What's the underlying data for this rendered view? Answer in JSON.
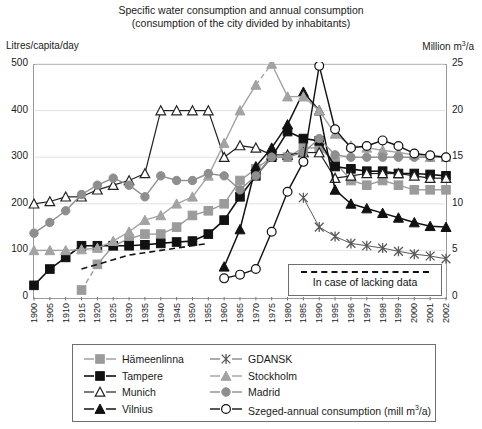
{
  "title": {
    "line1": "Specific water consumption and annual consumption",
    "line2": "(consumption of the city divided by inhabitants)"
  },
  "axis_labels": {
    "left": "Litres/capita/day",
    "right_prefix": "Million m",
    "right_sup": "3",
    "right_suffix": "/a"
  },
  "note_box": {
    "label": "In case of lacking data"
  },
  "legend": {
    "column1": [
      {
        "name": "Hämeenlinna",
        "marker": "square",
        "color": "#9b9b9b",
        "line": "#9b9b9b"
      },
      {
        "name": "Tampere",
        "marker": "square",
        "color": "#111111",
        "line": "#111111"
      },
      {
        "name": "Munich",
        "marker": "triangle-open",
        "color": "#ffffff",
        "line": "#111111"
      },
      {
        "name": "Vilnius",
        "marker": "triangle",
        "color": "#111111",
        "line": "#111111"
      }
    ],
    "column2": [
      {
        "name": "GDANSK",
        "marker": "star",
        "color": "#5a5a5a",
        "line": "#5a5a5a"
      },
      {
        "name": "Stockholm",
        "marker": "triangle",
        "color": "#9b9b9b",
        "line": "#9b9b9b"
      },
      {
        "name": "Madrid",
        "marker": "circle",
        "color": "#8a8a8a",
        "line": "#8a8a8a"
      },
      {
        "name": "Szeged-annual consumption (mill m3/a)",
        "marker": "circle-open",
        "color": "#ffffff",
        "line": "#111111"
      }
    ]
  },
  "chart_data": {
    "type": "line",
    "title": "Specific water consumption and annual consumption (consumption of the city divided by inhabitants)",
    "xlabel": "",
    "ylabel": "Litres/capita/day",
    "y2label": "Million m3/a",
    "grid": true,
    "legend_position": "bottom",
    "ylim": [
      0,
      500
    ],
    "yticks": [
      0,
      100,
      200,
      300,
      400,
      500
    ],
    "y2lim": [
      0,
      25
    ],
    "y2ticks": [
      0,
      5,
      10,
      15,
      20,
      25
    ],
    "categories": [
      "1900",
      "1905",
      "1910",
      "1915",
      "1920",
      "1925",
      "1930",
      "1935",
      "1940",
      "1945",
      "1950",
      "1955",
      "1960",
      "1965",
      "1970",
      "1975",
      "1980",
      "1985",
      "1990",
      "1995",
      "1996",
      "1997",
      "1998",
      "1999",
      "2000",
      "2001",
      "2002"
    ],
    "series": [
      {
        "name": "Hämeenlinna",
        "axis": "left",
        "values": [
          null,
          null,
          null,
          15,
          70,
          110,
          125,
          135,
          135,
          150,
          175,
          185,
          200,
          250,
          275,
          300,
          300,
          320,
          320,
          290,
          250,
          240,
          250,
          240,
          230,
          230,
          230
        ]
      },
      {
        "name": "Tampere",
        "axis": "left",
        "values": [
          25,
          60,
          85,
          110,
          110,
          110,
          110,
          112,
          115,
          118,
          120,
          135,
          165,
          215,
          260,
          300,
          355,
          340,
          335,
          280,
          275,
          270,
          270,
          265,
          265,
          263,
          260
        ]
      },
      {
        "name": "Munich",
        "axis": "left",
        "values": [
          200,
          205,
          215,
          215,
          230,
          240,
          250,
          265,
          400,
          400,
          400,
          400,
          300,
          325,
          320,
          305,
          305,
          310,
          310,
          255,
          260,
          265,
          265,
          265,
          260,
          255,
          255
        ]
      },
      {
        "name": "Vilnius",
        "axis": "left",
        "values": [
          null,
          null,
          null,
          null,
          null,
          null,
          null,
          null,
          null,
          null,
          null,
          null,
          65,
          145,
          280,
          320,
          370,
          440,
          400,
          230,
          200,
          190,
          180,
          170,
          160,
          152,
          150
        ]
      },
      {
        "name": "GDANSK",
        "axis": "left",
        "values": [
          null,
          null,
          null,
          null,
          null,
          null,
          null,
          null,
          null,
          null,
          null,
          null,
          null,
          null,
          null,
          null,
          null,
          213,
          150,
          130,
          115,
          110,
          105,
          98,
          92,
          88,
          82
        ]
      },
      {
        "name": "Stockholm",
        "axis": "left",
        "values": [
          100,
          100,
          100,
          102,
          105,
          120,
          140,
          165,
          175,
          200,
          215,
          260,
          330,
          400,
          455,
          500,
          430,
          430,
          400,
          350,
          325,
          320,
          315,
          310,
          305,
          300,
          300
        ]
      },
      {
        "name": "Madrid",
        "axis": "left",
        "values": [
          137,
          160,
          185,
          220,
          240,
          255,
          240,
          215,
          260,
          250,
          250,
          265,
          260,
          230,
          260,
          300,
          300,
          310,
          340,
          305,
          300,
          300,
          300,
          300,
          300,
          300,
          300
        ]
      },
      {
        "name": "Szeged-annual consumption (mill m3/a)",
        "axis": "right",
        "values": [
          null,
          null,
          null,
          null,
          null,
          null,
          null,
          null,
          null,
          null,
          null,
          null,
          2.0,
          2.4,
          3.0,
          7.0,
          11.3,
          14.5,
          24.8,
          18.0,
          16.0,
          16.2,
          16.8,
          16.2,
          15.4,
          15.2,
          15.0
        ]
      }
    ],
    "dashed_segments": [
      {
        "series": "Hämeenlinna",
        "from": "1915",
        "to": "1920",
        "style": "dashed"
      },
      {
        "series": "Stockholm",
        "from": "1970",
        "to": "1975",
        "style": "dashed"
      }
    ],
    "dashed_reference": {
      "label": "In case of lacking data",
      "from": "1915",
      "to": "1955",
      "values": [
        60,
        70,
        80,
        90,
        95,
        100,
        105,
        110,
        115
      ]
    }
  }
}
